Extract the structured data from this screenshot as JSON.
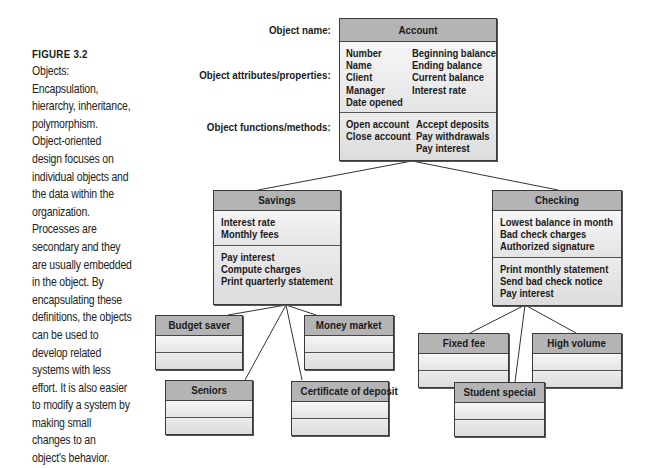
{
  "caption": {
    "figure_label": "FIGURE 3.2",
    "text": "Objects: Encapsulation, hierarchy, inheritance, polymorphism. Object-oriented design focuses on individual objects and the data within the organization. Processes are secondary and they are usually embedded in the object. By encapsulating these definitions, the objects can be used to develop related systems with less effort. It is also easier to modify a system by making small changes to an object's behavior."
  },
  "row_labels": {
    "name": "Object name:",
    "attributes": "Object attributes/properties:",
    "methods": "Object functions/methods:"
  },
  "account": {
    "name": "Account",
    "attributes_col1": [
      "Number",
      "Name",
      "Client",
      "Manager",
      "Date opened"
    ],
    "attributes_col2": [
      "Beginning balance",
      "Ending balance",
      "Current balance",
      "Interest rate"
    ],
    "methods_col1": [
      "Open account",
      "Close account"
    ],
    "methods_col2": [
      "Accept deposits",
      "Pay withdrawals",
      "Pay interest"
    ]
  },
  "savings": {
    "name": "Savings",
    "attributes": [
      "Interest rate",
      "Monthly fees"
    ],
    "methods": [
      "Pay interest",
      "Compute charges",
      "Print quarterly statement"
    ]
  },
  "checking": {
    "name": "Checking",
    "attributes": [
      "Lowest balance in month",
      "Bad check charges",
      "Authorized signature"
    ],
    "methods": [
      "Print monthly statement",
      "Send bad check notice",
      "Pay interest"
    ]
  },
  "savings_children": [
    "Budget saver",
    "Money market",
    "Seniors",
    "Certificate of deposit"
  ],
  "checking_children": [
    "Fixed fee",
    "High volume",
    "Student special"
  ],
  "colors": {
    "header_fill": "#b4b4b4",
    "body_fill": "#e6e6e6",
    "border": "#3a3a3a"
  }
}
